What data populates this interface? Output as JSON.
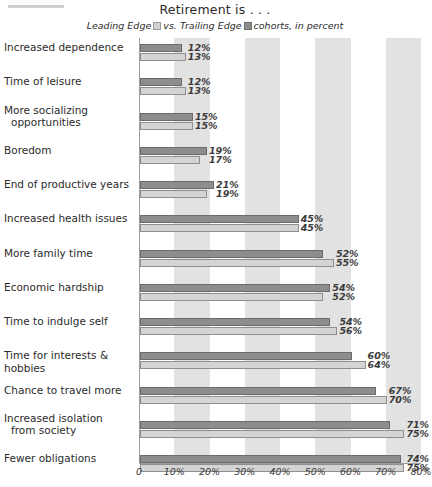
{
  "header": {
    "rule": ""
  },
  "chart_data": {
    "type": "bar",
    "orientation": "horizontal",
    "title": "Retirement is . . .",
    "legend": {
      "prefix": "Leading Edge",
      "middle": "vs. Trailing Edge",
      "suffix": "cohorts, in percent",
      "series_order_note": "dark bar on top, light bar below",
      "entries": [
        {
          "name": "Leading Edge",
          "swatch": "light",
          "color": "#d4d4d4"
        },
        {
          "name": "Trailing Edge",
          "swatch": "dark",
          "color": "#8d8d8d"
        }
      ]
    },
    "xlabel": "",
    "ylabel": "",
    "xlim": [
      0,
      80
    ],
    "grid": false,
    "bands": [
      [
        10,
        20
      ],
      [
        30,
        40
      ],
      [
        50,
        60
      ],
      [
        70,
        80
      ]
    ],
    "band_color": "#e2e2e2",
    "xticks": [
      0,
      10,
      20,
      30,
      40,
      50,
      60,
      70,
      80
    ],
    "xticklabels": [
      "0",
      "10%",
      "20%",
      "30%",
      "40%",
      "50%",
      "60%",
      "70%",
      "80%"
    ],
    "categories": [
      "Increased dependence",
      "Time of leisure",
      "More socializing opportunities",
      "Boredom",
      "End of productive years",
      "Increased health issues",
      "More family time",
      "Economic hardship",
      "Time to indulge self",
      "Time for interests & hobbies",
      "Chance to travel more",
      "Increased isolation from society",
      "Fewer obligations"
    ],
    "series": [
      {
        "name": "Trailing Edge",
        "color": "#8d8d8d",
        "values": [
          12,
          12,
          15,
          19,
          21,
          45,
          52,
          54,
          54,
          60,
          67,
          71,
          74
        ],
        "labels": [
          "12%",
          "12%",
          "15%",
          "19%",
          "21%",
          "45%",
          "52%",
          "54%",
          "54%",
          "60%",
          "67%",
          "71%",
          "74%"
        ]
      },
      {
        "name": "Leading Edge",
        "color": "#d4d4d4",
        "values": [
          13,
          13,
          15,
          17,
          19,
          45,
          55,
          52,
          56,
          64,
          70,
          75,
          75
        ],
        "labels": [
          "13%",
          "13%",
          "15%",
          "17%",
          "19%",
          "45%",
          "55%",
          "52%",
          "56%",
          "64%",
          "70%",
          "75%",
          "75%"
        ]
      }
    ],
    "rows": [
      {
        "label": "Increased dependence",
        "label_lines": [
          "Increased dependence"
        ],
        "dark": 12,
        "light": 13,
        "dark_label": "12%",
        "light_label": "13%"
      },
      {
        "label": "Time of leisure",
        "label_lines": [
          "Time of leisure"
        ],
        "dark": 12,
        "light": 13,
        "dark_label": "12%",
        "light_label": "13%"
      },
      {
        "label": "More socializing opportunities",
        "label_lines": [
          "More socializing",
          "opportunities"
        ],
        "dark": 15,
        "light": 15,
        "dark_label": "15%",
        "light_label": "15%"
      },
      {
        "label": "Boredom",
        "label_lines": [
          "Boredom"
        ],
        "dark": 19,
        "light": 17,
        "dark_label": "19%",
        "light_label": "17%"
      },
      {
        "label": "End of productive years",
        "label_lines": [
          "End of productive years"
        ],
        "dark": 21,
        "light": 19,
        "dark_label": "21%",
        "light_label": "19%"
      },
      {
        "label": "Increased health issues",
        "label_lines": [
          "Increased health issues"
        ],
        "dark": 45,
        "light": 45,
        "dark_label": "45%",
        "light_label": "45%"
      },
      {
        "label": "More family time",
        "label_lines": [
          "More family time"
        ],
        "dark": 52,
        "light": 55,
        "dark_label": "52%",
        "light_label": "55%"
      },
      {
        "label": "Economic hardship",
        "label_lines": [
          "Economic hardship"
        ],
        "dark": 54,
        "light": 52,
        "dark_label": "54%",
        "light_label": "52%"
      },
      {
        "label": "Time to indulge self",
        "label_lines": [
          "Time to indulge self"
        ],
        "dark": 54,
        "light": 56,
        "dark_label": "54%",
        "light_label": "56%"
      },
      {
        "label": "Time for interests & hobbies",
        "label_lines": [
          "Time for interests & hobbies"
        ],
        "dark": 60,
        "light": 64,
        "dark_label": "60%",
        "light_label": "64%"
      },
      {
        "label": "Chance to travel more",
        "label_lines": [
          "Chance to travel more"
        ],
        "dark": 67,
        "light": 70,
        "dark_label": "67%",
        "light_label": "70%"
      },
      {
        "label": "Increased isolation from society",
        "label_lines": [
          "Increased isolation",
          "from society"
        ],
        "dark": 71,
        "light": 75,
        "dark_label": "71%",
        "light_label": "75%"
      },
      {
        "label": "Fewer obligations",
        "label_lines": [
          "Fewer obligations"
        ],
        "dark": 74,
        "light": 75,
        "dark_label": "74%",
        "light_label": "75%"
      }
    ]
  }
}
